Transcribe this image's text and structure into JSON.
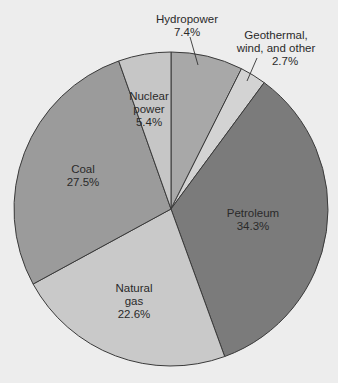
{
  "chart_data": {
    "type": "pie",
    "title": "",
    "start_angle_deg": 0,
    "direction": "clockwise",
    "center": [
      171,
      209
    ],
    "radius": 157,
    "slices": [
      {
        "name": "Hydropower",
        "value": 7.4,
        "label_lines": [
          "Hydropower",
          "7.4%"
        ],
        "color": "#a8a8a8",
        "label_pos": [
          187,
          19
        ],
        "leader": [
          [
            190,
            37
          ],
          [
            198,
            65
          ]
        ]
      },
      {
        "name": "Geothermal, wind, and other",
        "value": 2.7,
        "label_lines": [
          "Geothermal,",
          "wind, and other",
          "2.7%"
        ],
        "color": "#d3d3d3",
        "label_pos": [
          276,
          35
        ],
        "label_x_last": 285,
        "leader": [
          [
            257,
            58
          ],
          [
            247,
            81
          ]
        ]
      },
      {
        "name": "Petroleum",
        "value": 34.3,
        "label_lines": [
          "Petroleum",
          "34.3%"
        ],
        "color": "#7b7b7b",
        "label_pos": [
          253,
          213
        ]
      },
      {
        "name": "Natural gas",
        "value": 22.6,
        "label_lines": [
          "Natural",
          "gas",
          "22.6%"
        ],
        "color": "#c9c9c9",
        "label_pos": [
          134,
          288
        ]
      },
      {
        "name": "Coal",
        "value": 27.5,
        "label_lines": [
          "Coal",
          "27.5%"
        ],
        "color": "#9b9b9b",
        "label_pos": [
          83,
          169
        ]
      },
      {
        "name": "Nuclear power",
        "value": 5.4,
        "label_lines": [
          "Nuclear",
          "power",
          "5.4%"
        ],
        "color": "#c6c6c6",
        "label_pos": [
          149,
          96
        ]
      }
    ],
    "legend": "none",
    "line_height": 13
  },
  "colors": {
    "background": "#ededed",
    "outline": "#3a3a3a",
    "text": "#2a2a2a"
  }
}
